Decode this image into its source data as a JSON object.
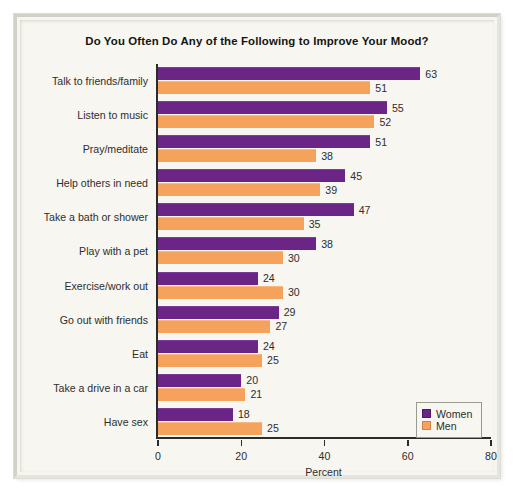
{
  "chart_data": {
    "type": "bar",
    "orientation": "horizontal",
    "title": "Do You Often Do Any of the Following to Improve Your Mood?",
    "xlabel": "Percent",
    "ylabel": "",
    "xlim": [
      0,
      80
    ],
    "xticks": [
      0,
      20,
      40,
      60,
      80
    ],
    "grid": false,
    "legend_position": "bottom-right",
    "categories": [
      "Talk to friends/family",
      "Listen to music",
      "Pray/meditate",
      "Help others in need",
      "Take a bath or shower",
      "Play with a pet",
      "Exercise/work out",
      "Go out with friends",
      "Eat",
      "Take a drive in a car",
      "Have sex"
    ],
    "series": [
      {
        "name": "Women",
        "color": "#6b2587",
        "values": [
          63,
          55,
          51,
          45,
          47,
          38,
          24,
          29,
          24,
          20,
          18
        ]
      },
      {
        "name": "Men",
        "color": "#f5a35c",
        "values": [
          51,
          52,
          38,
          39,
          35,
          30,
          30,
          27,
          25,
          21,
          25
        ]
      }
    ]
  },
  "legend": {
    "items": [
      {
        "label": "Women",
        "color": "#6b2587"
      },
      {
        "label": "Men",
        "color": "#f5a35c"
      }
    ]
  }
}
